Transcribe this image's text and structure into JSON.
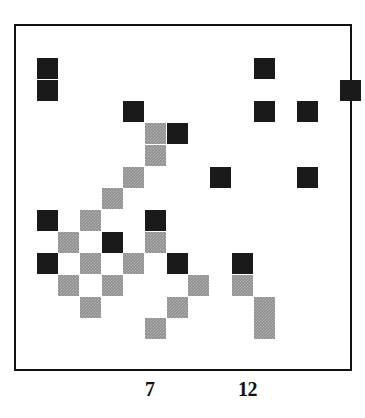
{
  "chart_data": {
    "type": "scatter",
    "title": "",
    "xlabel": "",
    "ylabel": "",
    "grid": false,
    "legend": "none",
    "cell_size_px": 21.7,
    "colors": {
      "dark": "#1a1a1a",
      "gray": "#8e8e8e",
      "frame": "#111111",
      "background": "#ffffff"
    },
    "xtick_labels": [
      "7",
      "12"
    ],
    "xtick_positions_px": [
      152,
      250
    ],
    "categories_note": "Grid of shaded cells; two shade levels: dark and gray (hatched).",
    "cells": [
      {
        "col": 0,
        "row": 0,
        "shade": "dark"
      },
      {
        "col": 10,
        "row": 0,
        "shade": "dark"
      },
      {
        "col": 0,
        "row": 1,
        "shade": "dark"
      },
      {
        "col": 14,
        "row": 1,
        "shade": "dark"
      },
      {
        "col": 4,
        "row": 2,
        "shade": "dark"
      },
      {
        "col": 10,
        "row": 2,
        "shade": "dark"
      },
      {
        "col": 12,
        "row": 2,
        "shade": "dark"
      },
      {
        "col": 5,
        "row": 3,
        "shade": "gray"
      },
      {
        "col": 6,
        "row": 3,
        "shade": "dark"
      },
      {
        "col": 5,
        "row": 4,
        "shade": "gray"
      },
      {
        "col": 4,
        "row": 5,
        "shade": "gray"
      },
      {
        "col": 8,
        "row": 5,
        "shade": "dark"
      },
      {
        "col": 12,
        "row": 5,
        "shade": "dark"
      },
      {
        "col": 3,
        "row": 6,
        "shade": "gray"
      },
      {
        "col": 0,
        "row": 7,
        "shade": "dark"
      },
      {
        "col": 2,
        "row": 7,
        "shade": "gray"
      },
      {
        "col": 5,
        "row": 7,
        "shade": "dark"
      },
      {
        "col": 1,
        "row": 8,
        "shade": "gray"
      },
      {
        "col": 3,
        "row": 8,
        "shade": "dark"
      },
      {
        "col": 5,
        "row": 8,
        "shade": "gray"
      },
      {
        "col": 0,
        "row": 9,
        "shade": "dark"
      },
      {
        "col": 2,
        "row": 9,
        "shade": "gray"
      },
      {
        "col": 4,
        "row": 9,
        "shade": "gray"
      },
      {
        "col": 6,
        "row": 9,
        "shade": "dark"
      },
      {
        "col": 9,
        "row": 9,
        "shade": "dark"
      },
      {
        "col": 1,
        "row": 10,
        "shade": "gray"
      },
      {
        "col": 3,
        "row": 10,
        "shade": "gray"
      },
      {
        "col": 7,
        "row": 10,
        "shade": "gray"
      },
      {
        "col": 9,
        "row": 10,
        "shade": "gray"
      },
      {
        "col": 2,
        "row": 11,
        "shade": "gray"
      },
      {
        "col": 6,
        "row": 11,
        "shade": "gray"
      },
      {
        "col": 10,
        "row": 11,
        "shade": "gray"
      },
      {
        "col": 5,
        "row": 12,
        "shade": "gray"
      },
      {
        "col": 10,
        "row": 12,
        "shade": "gray"
      }
    ]
  },
  "axis": {
    "ticks": [
      {
        "label": "7",
        "x": 145
      },
      {
        "label": "12",
        "x": 238
      }
    ]
  }
}
